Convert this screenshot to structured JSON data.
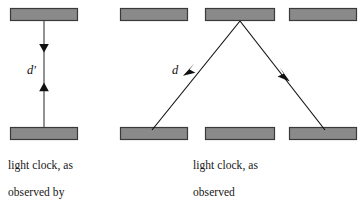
{
  "figure": {
    "background_color": "#ffffff",
    "plate_fill_color": "#8a8a8a",
    "plate_stroke_color": "#3a3a3a",
    "ray_color": "#111111",
    "text_color": "#161616"
  },
  "panels": {
    "astronaut": {
      "caption": "light clock, as observed by astronaut",
      "caption_lines": [
        "light clock, as",
        "observed by",
        "astronaut"
      ],
      "distance_label": "d′",
      "plates": [
        {
          "name": "top-mirror",
          "x": 10,
          "y": 8,
          "width": 68,
          "height": 13
        },
        {
          "name": "bottom-mirror",
          "x": 10,
          "y": 127,
          "width": 68,
          "height": 13
        }
      ],
      "light_path": {
        "type": "vertical-round-trip",
        "x": 44,
        "y_top": 21,
        "y_bottom": 127,
        "arrow_down_at_y": 50,
        "arrow_up_at_y": 88
      }
    },
    "earth": {
      "caption": "light clock, as observed from earth",
      "caption_lines": [
        "light clock, as",
        "observed",
        "from earth"
      ],
      "distance_label": "d",
      "plates_top": [
        {
          "name": "top-mirror-position-1",
          "x": 120,
          "y": 8,
          "width": 68,
          "height": 13
        },
        {
          "name": "top-mirror-position-2",
          "x": 205,
          "y": 8,
          "width": 70,
          "height": 13
        },
        {
          "name": "top-mirror-position-3",
          "x": 289,
          "y": 8,
          "width": 68,
          "height": 13
        }
      ],
      "plates_bottom": [
        {
          "name": "bottom-mirror-position-1",
          "x": 120,
          "y": 127,
          "width": 68,
          "height": 13
        },
        {
          "name": "bottom-mirror-position-2",
          "x": 205,
          "y": 127,
          "width": 70,
          "height": 13
        },
        {
          "name": "bottom-mirror-position-3",
          "x": 289,
          "y": 127,
          "width": 68,
          "height": 13
        }
      ],
      "light_path": {
        "type": "diagonal-triangle",
        "start": {
          "x": 152,
          "y": 129
        },
        "apex": {
          "x": 240,
          "y": 21
        },
        "end": {
          "x": 325,
          "y": 129
        },
        "arrow_up_left_at": {
          "x": 186,
          "y": 72
        },
        "arrow_down_right_at": {
          "x": 286,
          "y": 77
        }
      }
    }
  }
}
